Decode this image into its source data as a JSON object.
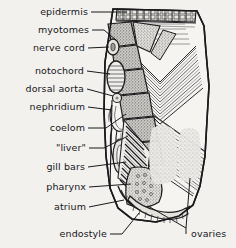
{
  "figure": {
    "organism": "amphioxus",
    "view": "transverse section, cut-away of body wall",
    "background_color": "#f2f1ee",
    "ink_color": "#1a1a1c"
  },
  "labels_left": [
    {
      "id": "epidermis",
      "text": "epidermis",
      "x": 35,
      "y": 12,
      "leader": "horizontal"
    },
    {
      "id": "myotomes",
      "text": "myotomes",
      "x": 36,
      "y": 30,
      "leader": "down-right"
    },
    {
      "id": "nerve-cord",
      "text": "nerve cord",
      "x": 29,
      "y": 48,
      "leader": "horizontal"
    },
    {
      "id": "notochord",
      "text": "notochord",
      "x": 32,
      "y": 71,
      "leader": "horizontal"
    },
    {
      "id": "dorsal-aorta",
      "text": "dorsal aorta",
      "x": 21,
      "y": 89,
      "leader": "horizontal"
    },
    {
      "id": "nephridium",
      "text": "nephridium",
      "x": 26,
      "y": 107,
      "leader": "horizontal"
    },
    {
      "id": "coelom",
      "text": "coelom",
      "x": 45,
      "y": 128,
      "leader": "up-right"
    },
    {
      "id": "liver",
      "text": "\"liver\"",
      "x": 49,
      "y": 148,
      "leader": "up-right"
    },
    {
      "id": "gill-bars",
      "text": "gill bars",
      "x": 40,
      "y": 167,
      "leader": "horizontal"
    },
    {
      "id": "pharynx",
      "text": "pharynx",
      "x": 42,
      "y": 187,
      "leader": "horizontal"
    },
    {
      "id": "atrium",
      "text": "atrium",
      "x": 47,
      "y": 207,
      "leader": "horizontal"
    },
    {
      "id": "endostyle",
      "text": "endostyle",
      "x": 62,
      "y": 234,
      "leader": "up-right"
    }
  ],
  "labels_right": [
    {
      "id": "ovaries",
      "text": "ovaries",
      "x": 188,
      "y": 232,
      "leader": "up-left-fork"
    }
  ],
  "structures": [
    {
      "id": "epidermis-band",
      "name": "epidermis",
      "kind": "cellular-band"
    },
    {
      "id": "myotome-blocks",
      "name": "myotomes",
      "kind": "stippled-blocks",
      "count": 7
    },
    {
      "id": "nerve-cord-body",
      "name": "nerve cord",
      "kind": "oval"
    },
    {
      "id": "notochord-body",
      "name": "notochord",
      "kind": "striated-oval"
    },
    {
      "id": "dorsal-aorta-body",
      "name": "dorsal aorta",
      "kind": "small-circle"
    },
    {
      "id": "nephridium-body",
      "name": "nephridium",
      "kind": "tubule"
    },
    {
      "id": "coelom-space",
      "name": "coelom",
      "kind": "cavity"
    },
    {
      "id": "liver-body",
      "name": "liver diverticulum",
      "kind": "stippled-lobe"
    },
    {
      "id": "gill-bar-array",
      "name": "gill bars",
      "kind": "diagonal-bars",
      "count": 16
    },
    {
      "id": "pharynx-cavity",
      "name": "pharynx",
      "kind": "cavity"
    },
    {
      "id": "atrium-cavity",
      "name": "atrium",
      "kind": "cavity"
    },
    {
      "id": "endostyle-body",
      "name": "endostyle",
      "kind": "ventral-groove"
    },
    {
      "id": "ovary-patch",
      "name": "ovaries",
      "kind": "stippled-patch",
      "count": 2
    },
    {
      "id": "muscle-chevrons",
      "name": "myotome chevrons",
      "kind": "v-hatching"
    }
  ]
}
